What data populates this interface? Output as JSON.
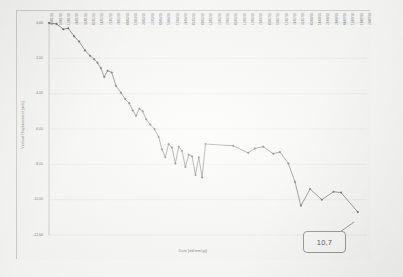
{
  "chart_data": {
    "type": "line",
    "title": "",
    "xlabel": "Date [dd/mm/yy]",
    "ylabel": "Vertical Displacement [mm]",
    "ylim": [
      -12.0,
      0.0
    ],
    "yticks": [
      "0,00",
      "-2,00",
      "-4,00",
      "-6,00",
      "-8,00",
      "-10,00",
      "-12,00"
    ],
    "ytick_values": [
      0.0,
      -2.0,
      -4.0,
      -6.0,
      -8.0,
      -10.0,
      -12.0
    ],
    "grid": true,
    "legend": false,
    "line_color": "#595957",
    "marker": "diamond",
    "categories": [
      "03/01/16",
      "10/01/16",
      "17/01/16",
      "24/01/16",
      "31/01/16",
      "07/02/16",
      "14/02/16",
      "21/02/16",
      "28/02/16",
      "06/03/16",
      "13/03/16",
      "20/03/16",
      "27/03/16",
      "03/04/16",
      "10/04/16",
      "17/04/16",
      "24/04/16",
      "01/05/16",
      "08/05/16",
      "15/05/16",
      "22/05/16",
      "29/05/16",
      "05/06/16",
      "12/06/16",
      "19/06/16",
      "26/06/16",
      "03/07/16",
      "10/07/16",
      "17/07/16",
      "24/07/16",
      "31/07/16",
      "07/08/16",
      "14/08/16",
      "21/08/16",
      "28/08/16",
      "04/09/16",
      "11/09/16",
      "18/09/16",
      "25/09/16"
    ],
    "series": [
      {
        "name": "Vertical Displacement",
        "points": [
          {
            "x": 0.0,
            "y": 0.0
          },
          {
            "x": 0.9,
            "y": -0.05
          },
          {
            "x": 1.7,
            "y": -0.35
          },
          {
            "x": 2.3,
            "y": -0.3
          },
          {
            "x": 3.0,
            "y": -0.75
          },
          {
            "x": 3.6,
            "y": -1.05
          },
          {
            "x": 4.3,
            "y": -1.55
          },
          {
            "x": 4.9,
            "y": -1.85
          },
          {
            "x": 5.4,
            "y": -2.05
          },
          {
            "x": 5.8,
            "y": -2.25
          },
          {
            "x": 6.2,
            "y": -2.55
          },
          {
            "x": 6.6,
            "y": -3.05
          },
          {
            "x": 7.0,
            "y": -2.7
          },
          {
            "x": 7.5,
            "y": -2.8
          },
          {
            "x": 8.0,
            "y": -3.55
          },
          {
            "x": 8.6,
            "y": -3.95
          },
          {
            "x": 9.1,
            "y": -4.3
          },
          {
            "x": 9.6,
            "y": -4.55
          },
          {
            "x": 10.0,
            "y": -4.95
          },
          {
            "x": 10.4,
            "y": -5.25
          },
          {
            "x": 10.8,
            "y": -4.85
          },
          {
            "x": 11.2,
            "y": -5.0
          },
          {
            "x": 11.6,
            "y": -5.45
          },
          {
            "x": 12.1,
            "y": -5.75
          },
          {
            "x": 12.6,
            "y": -6.0
          },
          {
            "x": 13.1,
            "y": -6.45
          },
          {
            "x": 13.5,
            "y": -7.15
          },
          {
            "x": 13.9,
            "y": -7.6
          },
          {
            "x": 14.3,
            "y": -6.85
          },
          {
            "x": 14.7,
            "y": -7.05
          },
          {
            "x": 15.1,
            "y": -7.95
          },
          {
            "x": 15.5,
            "y": -7.0
          },
          {
            "x": 15.9,
            "y": -7.25
          },
          {
            "x": 16.3,
            "y": -8.15
          },
          {
            "x": 16.7,
            "y": -7.45
          },
          {
            "x": 17.1,
            "y": -7.55
          },
          {
            "x": 17.5,
            "y": -8.6
          },
          {
            "x": 17.9,
            "y": -7.6
          },
          {
            "x": 18.3,
            "y": -8.75
          },
          {
            "x": 18.7,
            "y": -6.85
          },
          {
            "x": 22.0,
            "y": -6.95
          },
          {
            "x": 23.8,
            "y": -7.35
          },
          {
            "x": 24.6,
            "y": -7.1
          },
          {
            "x": 25.6,
            "y": -7.0
          },
          {
            "x": 26.8,
            "y": -7.4
          },
          {
            "x": 27.6,
            "y": -7.3
          },
          {
            "x": 28.6,
            "y": -7.95
          },
          {
            "x": 29.4,
            "y": -9.0
          },
          {
            "x": 30.1,
            "y": -10.35
          },
          {
            "x": 31.2,
            "y": -9.4
          },
          {
            "x": 32.6,
            "y": -10.0
          },
          {
            "x": 34.0,
            "y": -9.55
          },
          {
            "x": 34.9,
            "y": -9.6
          },
          {
            "x": 36.9,
            "y": -10.7
          }
        ]
      }
    ],
    "annotations": [
      {
        "text": "10,7",
        "kind": "callout-box"
      }
    ]
  },
  "callout": {
    "value": "10,7"
  }
}
